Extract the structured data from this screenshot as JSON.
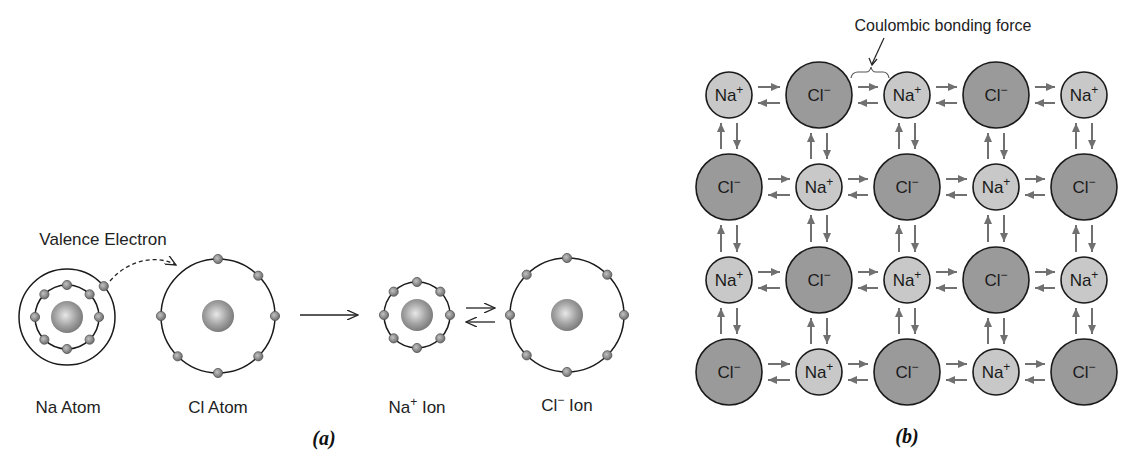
{
  "figure": {
    "panel_a": {
      "caption": "(a)",
      "valence_label": "Valence Electron",
      "species": [
        {
          "id": "na_atom",
          "label": "Na Atom",
          "cx": 67,
          "cy": 317,
          "nucleus_r": 16,
          "shells": [
            {
              "r": 32,
              "electrons": 8
            },
            {
              "r": 48,
              "electrons": 1
            }
          ]
        },
        {
          "id": "cl_atom",
          "label": "Cl Atom",
          "cx": 218,
          "cy": 316,
          "nucleus_r": 16,
          "shells": [
            {
              "r": 57,
              "electrons": 7
            }
          ]
        },
        {
          "id": "na_ion",
          "label_main": "Na",
          "label_sup": "+",
          "label_rest": " Ion",
          "cx": 417,
          "cy": 315,
          "nucleus_r": 16,
          "shells": [
            {
              "r": 33,
              "electrons": 8
            }
          ]
        },
        {
          "id": "cl_ion",
          "label_main": "Cl",
          "label_sup": "−",
          "label_rest": " Ion",
          "cx": 567,
          "cy": 315,
          "nucleus_r": 16,
          "shells": [
            {
              "r": 57,
              "electrons": 8
            }
          ]
        }
      ]
    },
    "panel_b": {
      "caption": "(b)",
      "annotation": "Coulombic bonding force",
      "columns_x": [
        729,
        819,
        907,
        996,
        1084
      ],
      "rows_y": [
        95,
        187,
        280,
        372
      ],
      "na_label": "Na",
      "na_sup": "+",
      "cl_label": "Cl",
      "cl_sup": "−",
      "na_radius": 23,
      "cl_radius": 33
    },
    "colors": {
      "na_fill": "#c8c8c8",
      "cl_fill": "#9a9a9a",
      "stroke": "#1a1a1a",
      "arrow": "#707070",
      "electron": "#8a8a8a",
      "nucleus": "#9d9d9d"
    }
  }
}
